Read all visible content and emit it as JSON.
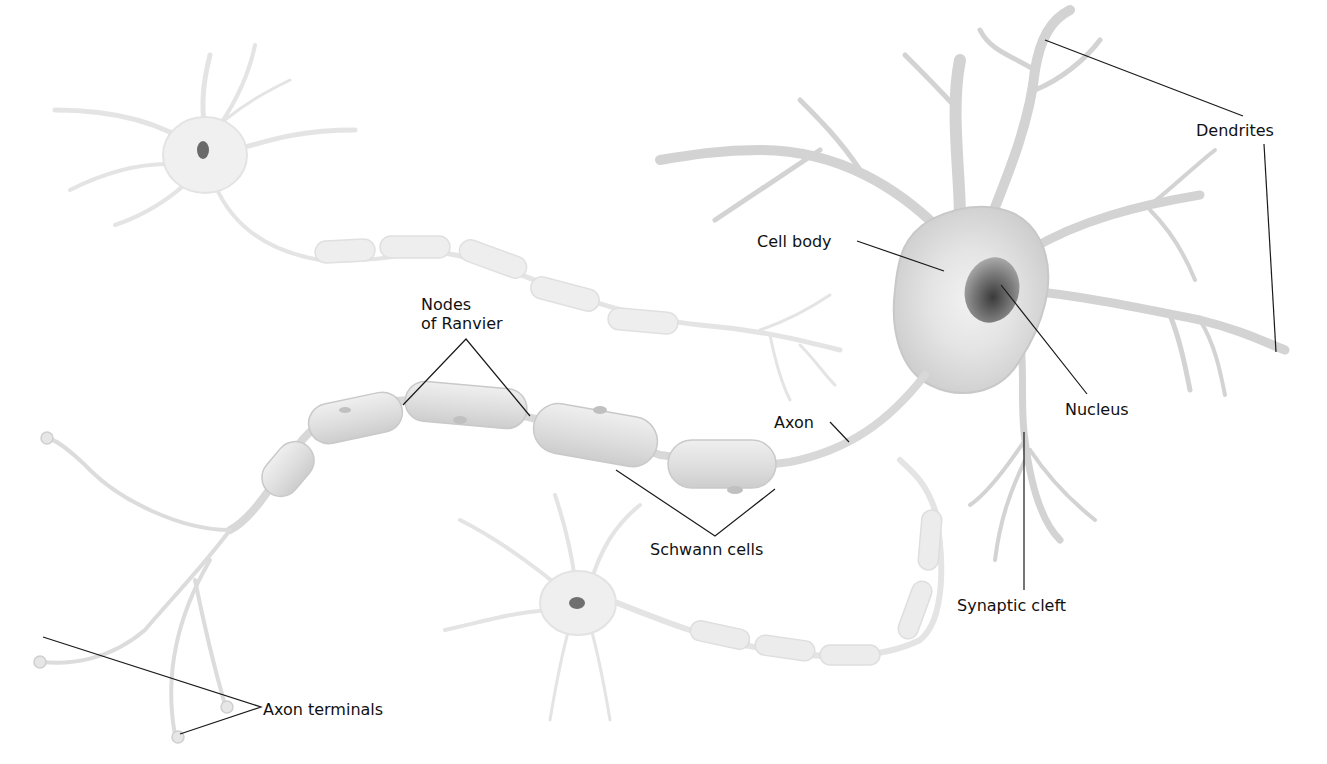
{
  "diagram": {
    "colors": {
      "background": "#ffffff",
      "neuron_fill": "#d6d6d6",
      "neuron_faint": "#ececec",
      "nucleus": "#555555",
      "leader_line": "#1a1a1a",
      "label_text": "#111111"
    },
    "labels": {
      "dendrites": "Dendrites",
      "cell_body": "Cell body",
      "nucleus": "Nucleus",
      "nodes_line1": "Nodes",
      "nodes_line2": "of Ranvier",
      "axon": "Axon",
      "schwann_cells": "Schwann cells",
      "synaptic_cleft": "Synaptic cleft",
      "axon_terminals": "Axon terminals"
    }
  }
}
